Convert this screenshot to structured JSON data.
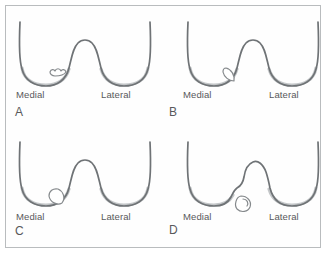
{
  "figure": {
    "border_color": "#b9bcbe",
    "background_color": "#ffffff",
    "outline_color": "#6f7376",
    "shadow_color": "#c3c6c8",
    "label_color": "#58595b"
  },
  "panels": [
    {
      "letter": "A",
      "medial_label": "Medial",
      "lateral_label": "Lateral",
      "lesion": "irregular-softening-flap",
      "lesion_side": "medial-condyle-floor",
      "description": "Small irregular wavy softening of articular cartilage on the medial condyle"
    },
    {
      "letter": "B",
      "medial_label": "Medial",
      "lateral_label": "Lateral",
      "lesion": "in-situ-fragment",
      "lesion_side": "medial-condyle-notch-junction",
      "description": "Lens-shaped osteochondral fragment still seated in situ"
    },
    {
      "letter": "C",
      "medial_label": "Medial",
      "lateral_label": "Lateral",
      "lesion": "partially-detached-fragment",
      "lesion_side": "medial-condyle-base",
      "description": "Oval fragment partially detached, hinged at the medial condyle base"
    },
    {
      "letter": "D",
      "medial_label": "Medial",
      "lateral_label": "Lateral",
      "lesion": "loose-body-with-empty-crater",
      "lesion_side": "medial-condyle-crater",
      "description": "Completely detached loose body with an empty donor crater in the condyle"
    }
  ]
}
